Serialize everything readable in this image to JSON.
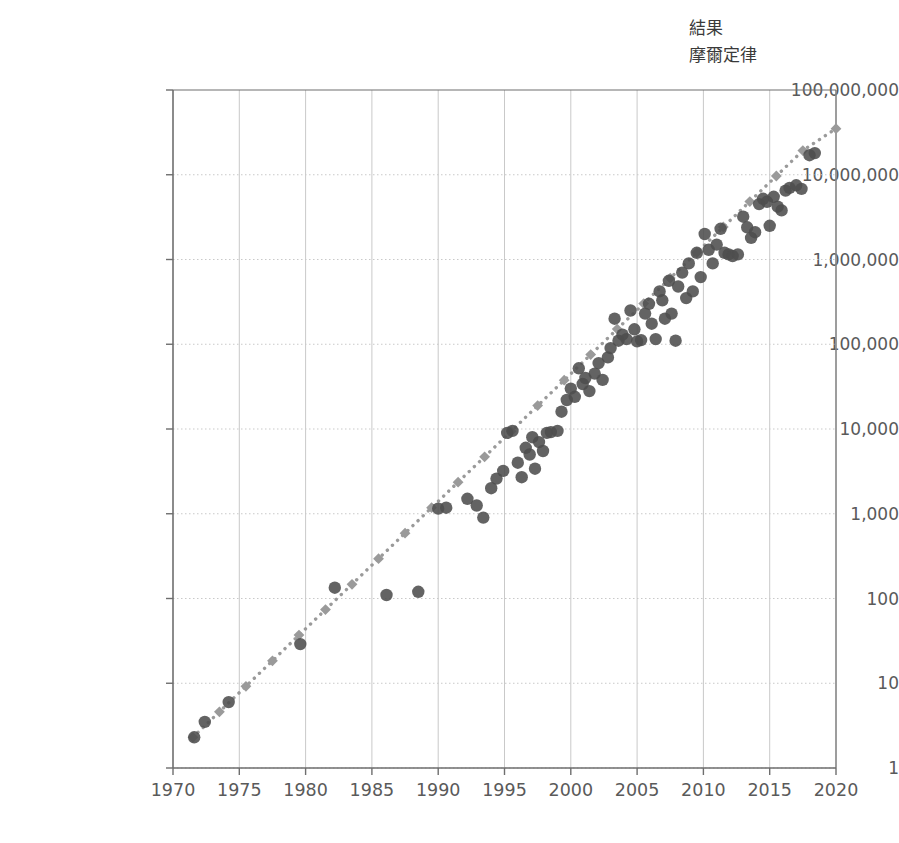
{
  "legend": {
    "position": "top-right",
    "items": [
      {
        "label": "結果",
        "marker": "circle-marker-icon",
        "color": "#4d4d4d"
      },
      {
        "label": "摩爾定律",
        "marker": "diamond-marker-icon",
        "color": "#9a9a9a"
      }
    ]
  },
  "axes": {
    "y_tick_labels": [
      "100,000,000",
      "10,000,000",
      "1,000,000",
      "100,000",
      "10,000",
      "1,000",
      "100",
      "10",
      "1"
    ],
    "x_tick_labels": [
      "1970",
      "1975",
      "1980",
      "1985",
      "1990",
      "1995",
      "2000",
      "2005",
      "2010",
      "2015",
      "2020"
    ]
  },
  "chart_data": {
    "type": "scatter",
    "title": "",
    "xlabel": "",
    "ylabel": "",
    "xlim": [
      1970,
      2020
    ],
    "ylim": [
      1,
      100000000
    ],
    "yscale": "log",
    "xscale": "linear",
    "grid": true,
    "legend_position": "top-right",
    "x_ticks": [
      1970,
      1975,
      1980,
      1985,
      1990,
      1995,
      2000,
      2005,
      2010,
      2015,
      2020
    ],
    "y_ticks": [
      1,
      10,
      100,
      1000,
      10000,
      100000,
      1000000,
      10000000,
      100000000
    ],
    "series": [
      {
        "name": "結果",
        "marker": "circle",
        "color": "#4d4d4d",
        "points": [
          [
            1971.6,
            2.3
          ],
          [
            1972.4,
            3.5
          ],
          [
            1974.2,
            6.0
          ],
          [
            1979.6,
            29
          ],
          [
            1982.2,
            134
          ],
          [
            1986.1,
            110
          ],
          [
            1988.5,
            120
          ],
          [
            1990.0,
            1150
          ],
          [
            1990.6,
            1180
          ],
          [
            1992.2,
            1500
          ],
          [
            1992.9,
            1250
          ],
          [
            1993.4,
            900
          ],
          [
            1994.0,
            2000
          ],
          [
            1994.4,
            2600
          ],
          [
            1994.9,
            3200
          ],
          [
            1995.2,
            9000
          ],
          [
            1995.6,
            9500
          ],
          [
            1996.0,
            4000
          ],
          [
            1996.3,
            2700
          ],
          [
            1996.6,
            6000
          ],
          [
            1996.9,
            5000
          ],
          [
            1997.1,
            8000
          ],
          [
            1997.3,
            3400
          ],
          [
            1997.6,
            7000
          ],
          [
            1997.9,
            5500
          ],
          [
            1998.2,
            9000
          ],
          [
            1998.5,
            9200
          ],
          [
            1999.0,
            9500
          ],
          [
            1999.3,
            16000
          ],
          [
            1999.7,
            22000
          ],
          [
            2000.0,
            30000
          ],
          [
            2000.3,
            24000
          ],
          [
            2000.6,
            52000
          ],
          [
            2000.9,
            34000
          ],
          [
            2001.1,
            40000
          ],
          [
            2001.4,
            28000
          ],
          [
            2001.8,
            45000
          ],
          [
            2002.1,
            60000
          ],
          [
            2002.4,
            38000
          ],
          [
            2002.8,
            70000
          ],
          [
            2003.0,
            90000
          ],
          [
            2003.3,
            200000
          ],
          [
            2003.6,
            110000
          ],
          [
            2003.9,
            130000
          ],
          [
            2004.2,
            115000
          ],
          [
            2004.5,
            250000
          ],
          [
            2004.8,
            150000
          ],
          [
            2005.0,
            108000
          ],
          [
            2005.3,
            112000
          ],
          [
            2005.6,
            230000
          ],
          [
            2005.9,
            300000
          ],
          [
            2006.1,
            175000
          ],
          [
            2006.4,
            115000
          ],
          [
            2006.7,
            420000
          ],
          [
            2006.9,
            330000
          ],
          [
            2007.1,
            200000
          ],
          [
            2007.4,
            560000
          ],
          [
            2007.6,
            230000
          ],
          [
            2007.9,
            110000
          ],
          [
            2008.1,
            480000
          ],
          [
            2008.4,
            700000
          ],
          [
            2008.7,
            350000
          ],
          [
            2008.9,
            900000
          ],
          [
            2009.2,
            420000
          ],
          [
            2009.5,
            1200000
          ],
          [
            2009.8,
            620000
          ],
          [
            2010.1,
            2000000
          ],
          [
            2010.4,
            1300000
          ],
          [
            2010.7,
            900000
          ],
          [
            2011.0,
            1500000
          ],
          [
            2011.3,
            2300000
          ],
          [
            2011.6,
            1200000
          ],
          [
            2011.9,
            1150000
          ],
          [
            2012.2,
            1100000
          ],
          [
            2012.6,
            1150000
          ],
          [
            2013.0,
            3200000
          ],
          [
            2013.3,
            2400000
          ],
          [
            2013.6,
            1800000
          ],
          [
            2013.9,
            2100000
          ],
          [
            2014.2,
            4500000
          ],
          [
            2014.5,
            5200000
          ],
          [
            2014.8,
            4800000
          ],
          [
            2015.0,
            2500000
          ],
          [
            2015.3,
            5500000
          ],
          [
            2015.6,
            4200000
          ],
          [
            2015.9,
            3800000
          ],
          [
            2016.2,
            6500000
          ],
          [
            2016.5,
            7000000
          ],
          [
            2017.0,
            7500000
          ],
          [
            2017.4,
            6800000
          ],
          [
            2018.0,
            17000000
          ],
          [
            2018.4,
            18000000
          ]
        ]
      },
      {
        "name": "摩爾定律",
        "marker": "diamond",
        "line": "dotted",
        "color": "#9a9a9a",
        "description": "doubling every two years trend line",
        "points": [
          [
            1971.5,
            2.3
          ],
          [
            1973.5,
            4.6
          ],
          [
            1975.5,
            9.2
          ],
          [
            1977.5,
            18.4
          ],
          [
            1979.5,
            37
          ],
          [
            1981.5,
            74
          ],
          [
            1983.5,
            147
          ],
          [
            1985.5,
            295
          ],
          [
            1987.5,
            590
          ],
          [
            1989.5,
            1180
          ],
          [
            1991.5,
            2360
          ],
          [
            1993.5,
            4700
          ],
          [
            1995.5,
            9400
          ],
          [
            1997.5,
            18900
          ],
          [
            1999.5,
            37700
          ],
          [
            2001.5,
            75500
          ],
          [
            2003.5,
            151000
          ],
          [
            2005.5,
            302000
          ],
          [
            2007.5,
            604000
          ],
          [
            2009.5,
            1210000
          ],
          [
            2011.5,
            2420000
          ],
          [
            2013.5,
            4830000
          ],
          [
            2015.5,
            9660000
          ],
          [
            2017.5,
            19300000
          ],
          [
            2020.0,
            35000000
          ]
        ]
      }
    ]
  },
  "style": {
    "axis_color": "#6e6e6e",
    "grid_color": "#c9c9c9",
    "point_color": "#4d4d4d",
    "moore_color": "#9a9a9a",
    "text_color": "#5a5a5a",
    "background": "#ffffff"
  },
  "geometry": {
    "plot_left": 173,
    "plot_right": 836,
    "plot_top": 90,
    "plot_bottom": 768
  }
}
